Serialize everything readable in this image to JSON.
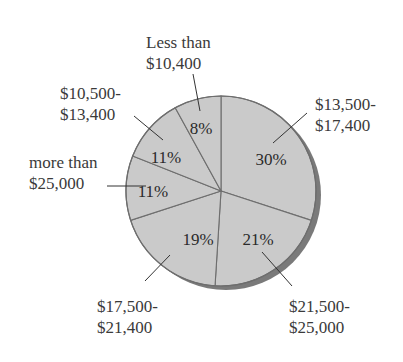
{
  "chart_data": {
    "type": "pie",
    "title": "",
    "start_angle_deg": 0,
    "direction": "clockwise",
    "categories": [
      "$13,500-$17,400",
      "$21,500-$25,000",
      "$17,500-$21,400",
      "more than $25,000",
      "$10,500-$13,400",
      "Less than $10,400"
    ],
    "values": [
      30,
      21,
      19,
      11,
      11,
      8
    ],
    "slices": [
      {
        "label_lines": [
          "$13,500-",
          "$17,400"
        ],
        "value": 30,
        "pct_text": "30%"
      },
      {
        "label_lines": [
          "$21,500-",
          "$25,000"
        ],
        "value": 21,
        "pct_text": "21%"
      },
      {
        "label_lines": [
          "$17,500-",
          "$21,400"
        ],
        "value": 19,
        "pct_text": "19%"
      },
      {
        "label_lines": [
          "more than",
          "$25,000"
        ],
        "value": 11,
        "pct_text": "11%"
      },
      {
        "label_lines": [
          "$10,500-",
          "$13,400"
        ],
        "value": 11,
        "pct_text": "11%"
      },
      {
        "label_lines": [
          "Less than",
          "$10,400"
        ],
        "value": 8,
        "pct_text": "8%"
      }
    ],
    "legend": "none (leader-line labels)",
    "colors": {
      "fill": "#cacaca",
      "edge": "#6e6e6e",
      "shadow": "#7a7a7a",
      "text": "#3a3a3a"
    }
  },
  "layout": {
    "cx": 221,
    "cy": 191,
    "r": 95,
    "shadow_dx": 5,
    "shadow_dy": 4,
    "pct_positions": [
      [
        271,
        165
      ],
      [
        258,
        245
      ],
      [
        198,
        245
      ],
      [
        153,
        197
      ],
      [
        166,
        163
      ],
      [
        201,
        134
      ]
    ],
    "leaders": [
      [
        [
          307,
          113
        ],
        [
          273,
          143
        ]
      ],
      [
        [
          292,
          286
        ],
        [
          262,
          252
        ]
      ],
      [
        [
          145,
          281
        ],
        [
          170,
          255
        ]
      ],
      [
        [
          107,
          186
        ],
        [
          146,
          186
        ]
      ],
      [
        [
          134,
          116
        ],
        [
          163,
          140
        ]
      ],
      [
        [
          193,
          74
        ],
        [
          200,
          111
        ]
      ]
    ],
    "label_positions": [
      {
        "x": 315,
        "y": 110,
        "anchor": "start"
      },
      {
        "x": 289,
        "y": 312,
        "anchor": "start"
      },
      {
        "x": 97,
        "y": 312,
        "anchor": "start"
      },
      {
        "x": 29,
        "y": 168,
        "anchor": "start"
      },
      {
        "x": 60,
        "y": 99,
        "anchor": "start"
      },
      {
        "x": 146,
        "y": 48,
        "anchor": "start"
      }
    ]
  }
}
